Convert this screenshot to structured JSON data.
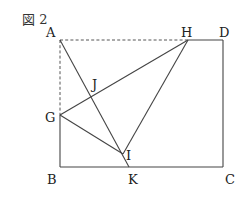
{
  "figure": {
    "title": "図 2",
    "points": {
      "A": {
        "label": "A",
        "x": 60,
        "y": 40
      },
      "H": {
        "label": "H",
        "x": 188,
        "y": 40
      },
      "D": {
        "label": "D",
        "x": 223,
        "y": 40
      },
      "G": {
        "label": "G",
        "x": 60,
        "y": 115
      },
      "J": {
        "label": "J",
        "x": 92,
        "y": 92
      },
      "I": {
        "label": "I",
        "x": 123,
        "y": 154
      },
      "B": {
        "label": "B",
        "x": 60,
        "y": 167
      },
      "K": {
        "label": "K",
        "x": 129,
        "y": 167
      },
      "C": {
        "label": "C",
        "x": 223,
        "y": 167
      }
    },
    "segments_solid": [
      "H-D",
      "D-C",
      "C-B",
      "B-G",
      "A-K",
      "G-H",
      "G-I",
      "H-I"
    ],
    "segments_dashed": [
      "A-H",
      "A-G"
    ]
  }
}
